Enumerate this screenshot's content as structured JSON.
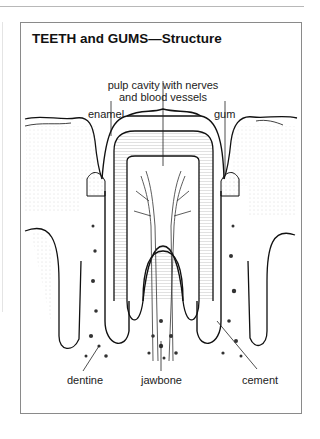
{
  "figure": {
    "title": "TEETH and GUMS—Structure",
    "labels": {
      "pulp_line1": "pulp cavity with nerves",
      "pulp_line2": "and blood vessels",
      "enamel": "enamel",
      "gum": "gum",
      "dentine": "dentine",
      "jawbone": "jawbone",
      "cement": "cement"
    }
  }
}
